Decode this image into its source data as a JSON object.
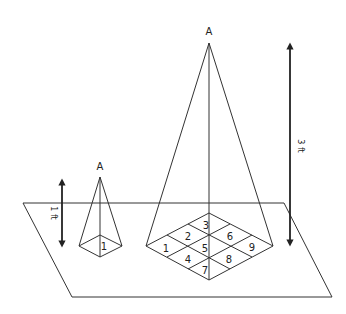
{
  "diagram": {
    "small_pyramid": {
      "apex_label": "A",
      "height_label": "1 ft",
      "base_cells": [
        "1"
      ]
    },
    "large_pyramid": {
      "apex_label": "A",
      "height_label": "3 ft",
      "base_cells": [
        "1",
        "2",
        "3",
        "4",
        "5",
        "6",
        "7",
        "8",
        "9"
      ]
    }
  }
}
